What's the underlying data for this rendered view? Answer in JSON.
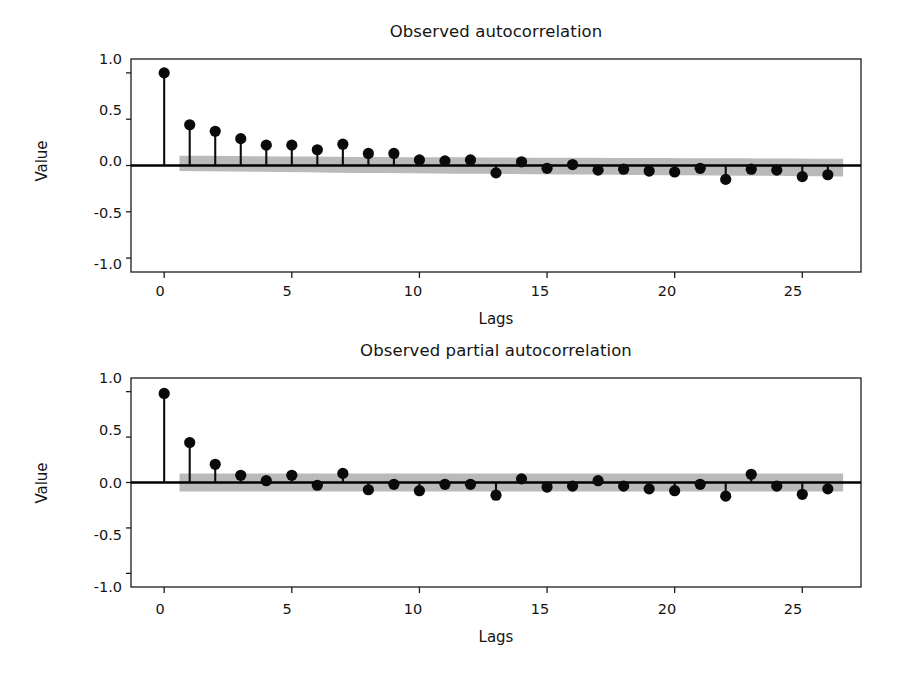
{
  "figure": {
    "background": "#ffffff",
    "marker_color": "#0a0a0a",
    "band_color": "#b4b4b4",
    "axis_color": "#1c1c1c"
  },
  "chart_data": [
    {
      "type": "bar",
      "subtype": "stem-correlogram",
      "id": "acf",
      "title": "Observed autocorrelation",
      "xlabel": "Lags",
      "ylabel": "Value",
      "xlim": [
        -1.3,
        27.3
      ],
      "ylim": [
        -1.15,
        1.15
      ],
      "ytick_labels": [
        "1.0",
        "0.5",
        "0.0",
        "-0.5",
        "-1.0"
      ],
      "ytick_values": [
        1.0,
        0.5,
        0.0,
        -0.5,
        -1.0
      ],
      "xtick_labels": [
        "0",
        "5",
        "10",
        "15",
        "20",
        "25"
      ],
      "xtick_values": [
        0,
        5,
        10,
        15,
        20,
        25
      ],
      "grid": false,
      "legend": "none",
      "categories": [
        0,
        1,
        2,
        3,
        4,
        5,
        6,
        7,
        8,
        9,
        10,
        11,
        12,
        13,
        14,
        15,
        16,
        17,
        18,
        19,
        20,
        21,
        22,
        23,
        24,
        25,
        26
      ],
      "values": [
        1.0,
        0.44,
        0.37,
        0.29,
        0.22,
        0.22,
        0.17,
        0.23,
        0.13,
        0.13,
        0.06,
        0.05,
        0.06,
        -0.08,
        0.04,
        -0.03,
        0.01,
        -0.05,
        -0.04,
        -0.06,
        -0.07,
        -0.03,
        -0.15,
        -0.04,
        -0.05,
        -0.12,
        -0.1
      ],
      "confidence_band": {
        "label": "95% confidence interval",
        "x_start": 0.6,
        "x_end": 26.6,
        "upper": [
          0.105,
          0.105,
          0.102,
          0.1,
          0.098,
          0.096,
          0.095,
          0.093,
          0.092,
          0.09,
          0.089,
          0.088,
          0.087,
          0.086,
          0.085,
          0.084,
          0.083,
          0.082,
          0.081,
          0.08,
          0.079,
          0.078,
          0.077,
          0.076,
          0.075,
          0.074,
          0.073
        ],
        "lower": [
          -0.06,
          -0.062,
          -0.065,
          -0.068,
          -0.071,
          -0.074,
          -0.077,
          -0.08,
          -0.082,
          -0.084,
          -0.086,
          -0.088,
          -0.09,
          -0.092,
          -0.094,
          -0.096,
          -0.098,
          -0.1,
          -0.102,
          -0.104,
          -0.106,
          -0.108,
          -0.11,
          -0.112,
          -0.114,
          -0.116,
          -0.118
        ]
      }
    },
    {
      "type": "bar",
      "subtype": "stem-correlogram",
      "id": "pacf",
      "title": "Observed partial autocorrelation",
      "xlabel": "Lags",
      "ylabel": "Value",
      "xlim": [
        -1.3,
        27.3
      ],
      "ylim": [
        -1.15,
        1.15
      ],
      "ytick_labels": [
        "1.0",
        "0.5",
        "0.0",
        "-0.5",
        "-1.0"
      ],
      "ytick_values": [
        1.0,
        0.5,
        0.0,
        -0.5,
        -1.0
      ],
      "xtick_labels": [
        "0",
        "5",
        "10",
        "15",
        "20",
        "25"
      ],
      "xtick_values": [
        0,
        5,
        10,
        15,
        20,
        25
      ],
      "grid": false,
      "legend": "none",
      "categories": [
        0,
        1,
        2,
        3,
        4,
        5,
        6,
        7,
        8,
        9,
        10,
        11,
        12,
        13,
        14,
        15,
        16,
        17,
        18,
        19,
        20,
        21,
        22,
        23,
        24,
        25,
        26
      ],
      "values": [
        0.98,
        0.44,
        0.2,
        0.08,
        0.02,
        0.08,
        -0.03,
        0.1,
        -0.08,
        -0.02,
        -0.09,
        -0.02,
        -0.02,
        -0.14,
        0.04,
        -0.05,
        -0.04,
        0.02,
        -0.04,
        -0.07,
        -0.09,
        -0.02,
        -0.15,
        0.09,
        -0.04,
        -0.13,
        -0.07
      ],
      "confidence_band": {
        "label": "95% confidence interval",
        "x_start": 0.6,
        "x_end": 26.6,
        "upper": [
          0.098,
          0.098,
          0.098,
          0.098,
          0.098,
          0.098,
          0.098,
          0.098,
          0.098,
          0.098,
          0.098,
          0.098,
          0.098,
          0.098,
          0.098,
          0.098,
          0.098,
          0.098,
          0.098,
          0.098,
          0.098,
          0.098,
          0.098,
          0.098,
          0.098,
          0.098,
          0.098
        ],
        "lower": [
          -0.098,
          -0.098,
          -0.098,
          -0.098,
          -0.098,
          -0.098,
          -0.098,
          -0.098,
          -0.098,
          -0.098,
          -0.098,
          -0.098,
          -0.098,
          -0.098,
          -0.098,
          -0.098,
          -0.098,
          -0.098,
          -0.098,
          -0.098,
          -0.098,
          -0.098,
          -0.098,
          -0.098,
          -0.098,
          -0.098,
          -0.098
        ]
      }
    }
  ]
}
